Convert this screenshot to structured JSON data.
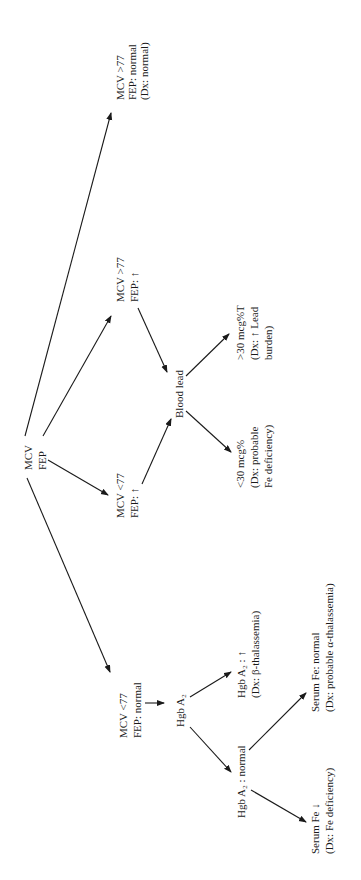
{
  "diagram": {
    "type": "decision-tree",
    "orientation": "rotated-90-ccw",
    "colors": {
      "ink": "#1a1a1a",
      "background": "#ffffff"
    },
    "nodes": {
      "root": {
        "lines": [
          "MCV",
          "FEP"
        ]
      },
      "mcv_gt77_fep_normal": {
        "lines": [
          "MCV >77",
          "FEP: normal",
          "(Dx: normal)"
        ]
      },
      "mcv_gt77_fep_up": {
        "lines": [
          "MCV >77",
          "FEP: ↑"
        ]
      },
      "mcv_lt77_fep_up": {
        "lines": [
          "MCV <77",
          "FEP: ↑"
        ]
      },
      "blood_lead": {
        "lines": [
          "Blood lead"
        ]
      },
      "lead_gt30": {
        "lines": [
          ">30 mcg%T",
          "(Dx: ↑ Lead",
          "burden)"
        ]
      },
      "lead_lt30": {
        "lines": [
          "<30 mcg%",
          "(Dx: probable",
          "Fe deficiency)"
        ]
      },
      "mcv_lt77_fep_normal": {
        "lines": [
          "MCV <77",
          "FEP: normal"
        ]
      },
      "hgb_a2": {
        "lines": [
          "Hgb A₂"
        ]
      },
      "hgb_a2_up": {
        "lines": [
          "Hgb A₂ : ↑",
          "(Dx: β-thalassemia)"
        ]
      },
      "hgb_a2_normal": {
        "lines": [
          "Hgb A₂ : normal"
        ]
      },
      "serum_fe_normal": {
        "lines": [
          "Serum Fe: normal",
          "(Dx: probable α-thalassemia)"
        ]
      },
      "serum_fe_down": {
        "lines": [
          "Serum Fe ↓",
          "(Dx: Fe deficiency)"
        ]
      }
    },
    "edges": [
      [
        "root",
        "mcv_gt77_fep_normal"
      ],
      [
        "root",
        "mcv_gt77_fep_up"
      ],
      [
        "root",
        "mcv_lt77_fep_up"
      ],
      [
        "root",
        "mcv_lt77_fep_normal"
      ],
      [
        "mcv_gt77_fep_up",
        "blood_lead"
      ],
      [
        "mcv_lt77_fep_up",
        "blood_lead"
      ],
      [
        "blood_lead",
        "lead_gt30"
      ],
      [
        "blood_lead",
        "lead_lt30"
      ],
      [
        "mcv_lt77_fep_normal",
        "hgb_a2"
      ],
      [
        "hgb_a2",
        "hgb_a2_up"
      ],
      [
        "hgb_a2",
        "hgb_a2_normal"
      ],
      [
        "hgb_a2_normal",
        "serum_fe_normal"
      ],
      [
        "hgb_a2_normal",
        "serum_fe_down"
      ]
    ]
  }
}
